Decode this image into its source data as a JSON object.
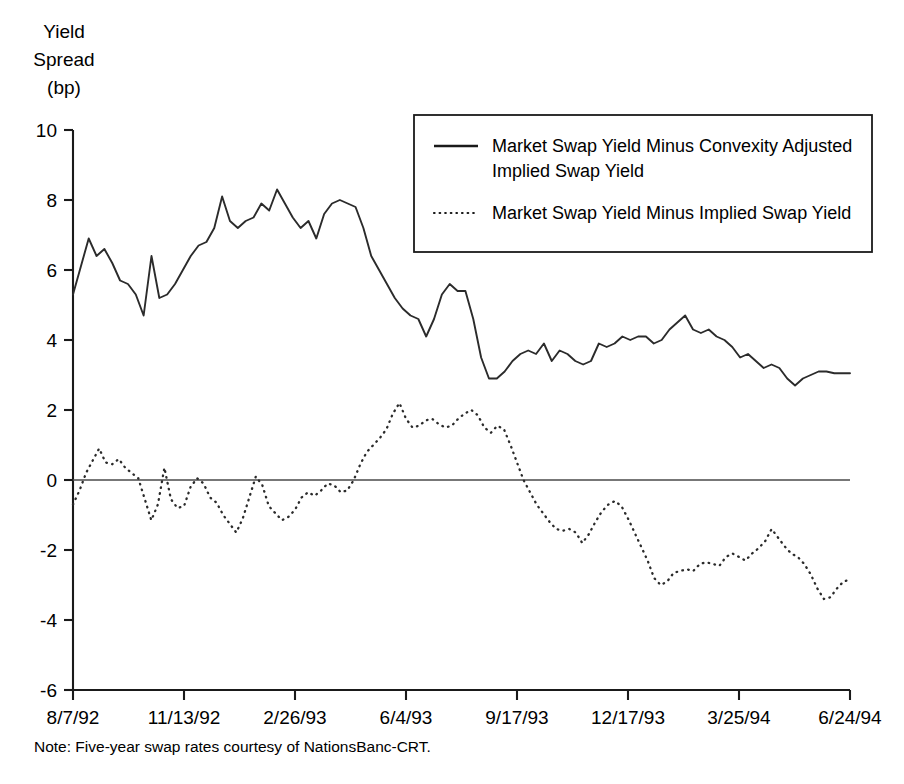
{
  "chart_data": {
    "type": "line",
    "title": "",
    "xlabel": "",
    "ylabel": "Yield Spread (bp)",
    "ylabel_lines": [
      "Yield",
      "Spread",
      "(bp)"
    ],
    "ylim": [
      -6,
      10
    ],
    "ytick_labels": [
      "10",
      "8",
      "6",
      "4",
      "2",
      "0",
      "-2",
      "-4",
      "-6"
    ],
    "ytick_values": [
      10,
      8,
      6,
      4,
      2,
      0,
      -2,
      -4,
      -6
    ],
    "xtick_labels": [
      "8/7/92",
      "11/13/92",
      "2/26/93",
      "6/4/93",
      "9/17/93",
      "12/17/93",
      "3/25/94",
      "6/24/94"
    ],
    "xtick_indices": [
      0,
      14,
      28,
      42,
      56,
      70,
      84,
      98
    ],
    "grid": false,
    "zero_line": true,
    "legend_position": "upper-right-inside",
    "note": "Note: Five-year swap rates courtesy of NationsBanc-CRT.",
    "series": [
      {
        "name": "Market Swap Yield Minus Convexity Adjusted Implied Swap Yield",
        "style": "solid",
        "color": "#2b2b2b",
        "values": [
          5.3,
          6.1,
          6.9,
          6.4,
          6.6,
          6.2,
          5.7,
          5.6,
          5.3,
          4.7,
          6.4,
          5.2,
          5.3,
          5.6,
          6.0,
          6.4,
          6.7,
          6.8,
          7.2,
          8.1,
          7.4,
          7.2,
          7.4,
          7.5,
          7.9,
          7.7,
          8.3,
          7.9,
          7.5,
          7.2,
          7.4,
          6.9,
          7.6,
          7.9,
          8.0,
          7.9,
          7.8,
          7.2,
          6.4,
          6.0,
          5.6,
          5.2,
          4.9,
          4.7,
          4.6,
          4.1,
          4.6,
          5.3,
          5.6,
          5.4,
          5.4,
          4.6,
          3.5,
          2.9,
          2.9,
          3.1,
          3.4,
          3.6,
          3.7,
          3.6,
          3.9,
          3.4,
          3.7,
          3.6,
          3.4,
          3.3,
          3.4,
          3.9,
          3.8,
          3.9,
          4.1,
          4.0,
          4.1,
          4.1,
          3.9,
          4.0,
          4.3,
          4.5,
          4.7,
          4.3,
          4.2,
          4.3,
          4.1,
          4.0,
          3.8,
          3.5,
          3.6,
          3.4,
          3.2,
          3.3,
          3.2,
          2.9,
          2.7,
          2.9,
          3.0,
          3.1,
          3.1,
          3.05,
          3.05,
          3.05
        ]
      },
      {
        "name": "Market Swap Yield Minus Implied Swap Yield",
        "style": "dotted",
        "color": "#2b2b2b",
        "values": [
          -0.7,
          -0.3,
          0.2,
          0.55,
          0.9,
          0.5,
          0.45,
          0.6,
          0.35,
          0.2,
          0.05,
          -0.55,
          -1.15,
          -0.7,
          0.35,
          -0.55,
          -0.8,
          -0.75,
          -0.2,
          0.05,
          -0.1,
          -0.5,
          -0.65,
          -1.0,
          -1.25,
          -1.5,
          -1.1,
          -0.5,
          0.1,
          -0.15,
          -0.75,
          -0.95,
          -1.15,
          -1.05,
          -0.85,
          -0.5,
          -0.35,
          -0.45,
          -0.3,
          -0.1,
          -0.15,
          -0.35,
          -0.3,
          0.0,
          0.45,
          0.8,
          1.0,
          1.2,
          1.45,
          1.9,
          2.2,
          1.75,
          1.5,
          1.55,
          1.7,
          1.75,
          1.6,
          1.5,
          1.55,
          1.75,
          1.9,
          2.0,
          1.85,
          1.5,
          1.35,
          1.55,
          1.45,
          1.0,
          0.5,
          0.0,
          -0.35,
          -0.7,
          -0.95,
          -1.2,
          -1.4,
          -1.45,
          -1.4,
          -1.5,
          -1.8,
          -1.55,
          -1.2,
          -0.9,
          -0.7,
          -0.6,
          -0.75,
          -1.1,
          -1.5,
          -1.9,
          -2.3,
          -2.8,
          -3.0,
          -2.9,
          -2.65,
          -2.6,
          -2.55,
          -2.6,
          -2.4,
          -2.35,
          -2.4,
          -2.45,
          -2.2,
          -2.1,
          -2.2,
          -2.3,
          -2.1,
          -1.95,
          -1.75,
          -1.4,
          -1.65,
          -1.9,
          -2.1,
          -2.2,
          -2.4,
          -2.7,
          -3.1,
          -3.4,
          -3.35,
          -3.1,
          -2.9,
          -2.85
        ]
      }
    ]
  },
  "axis": {
    "y_title_lines": [
      "Yield",
      "Spread",
      "(bp)"
    ]
  },
  "legend": {
    "entries": [
      {
        "label_line1": "Market Swap Yield Minus Convexity Adjusted",
        "label_line2": "Implied Swap Yield",
        "style": "solid"
      },
      {
        "label_line1": "Market Swap Yield Minus Implied Swap Yield",
        "label_line2": "",
        "style": "dotted"
      }
    ]
  },
  "footer": {
    "note": "Note: Five-year swap rates courtesy of NationsBanc-CRT."
  }
}
